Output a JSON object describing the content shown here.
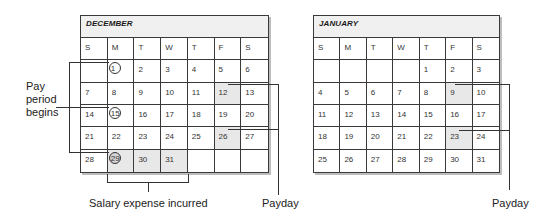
{
  "december": {
    "title": "DECEMBER",
    "days_of_week": [
      "S",
      "M",
      "T",
      "W",
      "T",
      "F",
      "S"
    ],
    "weeks": [
      [
        "",
        "1",
        "2",
        "3",
        "4",
        "5",
        "6"
      ],
      [
        "7",
        "8",
        "9",
        "10",
        "11",
        "12",
        "13"
      ],
      [
        "14",
        "15",
        "16",
        "17",
        "18",
        "19",
        "20"
      ],
      [
        "21",
        "22",
        "23",
        "24",
        "25",
        "26",
        "27"
      ],
      [
        "28",
        "29",
        "30",
        "31",
        "",
        "",
        ""
      ]
    ],
    "circled_days": [
      "1",
      "15",
      "29"
    ],
    "shaded_days": [
      "12",
      "26",
      "29",
      "30",
      "31"
    ]
  },
  "january": {
    "title": "JANUARY",
    "days_of_week": [
      "S",
      "M",
      "T",
      "W",
      "T",
      "F",
      "S"
    ],
    "weeks": [
      [
        "",
        "",
        "",
        "",
        "1",
        "2",
        "3"
      ],
      [
        "4",
        "5",
        "6",
        "7",
        "8",
        "9",
        "10"
      ],
      [
        "11",
        "12",
        "13",
        "14",
        "15",
        "16",
        "17"
      ],
      [
        "18",
        "19",
        "20",
        "21",
        "22",
        "23",
        "24"
      ],
      [
        "25",
        "26",
        "27",
        "28",
        "29",
        "30",
        "31"
      ]
    ],
    "circled_days": [],
    "shaded_days": [
      "9",
      "23"
    ]
  },
  "annotations": {
    "pay_period_line1": "Pay",
    "pay_period_line2": "period",
    "pay_period_line3": "begins",
    "salary_expense": "Salary expense incurred",
    "payday_december": "Payday",
    "payday_january": "Payday"
  },
  "colors": {
    "header_band": "#f0f0f0",
    "shaded_cell": "#e8e8e8",
    "grid_line": "#3a3a3a"
  }
}
